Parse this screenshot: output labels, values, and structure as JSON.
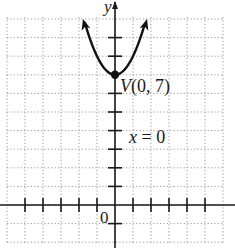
{
  "chart_data": {
    "type": "line",
    "title": "",
    "xlabel": "x",
    "ylabel": "y",
    "function": "y = x^2 + 7",
    "series": [
      {
        "name": "parabola",
        "x": [
          -1.67,
          -1.5,
          -1.25,
          -1,
          -0.75,
          -0.5,
          -0.25,
          0,
          0.25,
          0.5,
          0.75,
          1,
          1.25,
          1.5,
          1.67
        ],
        "y": [
          9.79,
          9.25,
          8.56,
          8,
          7.56,
          7.25,
          7.06,
          7,
          7.06,
          7.25,
          7.56,
          8,
          8.56,
          9.25,
          9.79
        ]
      }
    ],
    "xlim": [
      -6,
      6
    ],
    "ylim": [
      -1,
      10
    ],
    "grid": true,
    "x_ticks": [
      -5,
      -4,
      -3,
      -2,
      -1,
      1,
      2,
      3,
      4,
      5
    ],
    "y_ticks": [
      -1,
      1,
      2,
      3,
      4,
      5,
      6,
      8,
      9
    ],
    "annotations": [
      {
        "text": "V(0, 7)",
        "x": 0,
        "y": 7,
        "kind": "vertex"
      },
      {
        "text": "x = 0",
        "x": 0,
        "y": 4,
        "kind": "axis-of-symmetry"
      }
    ],
    "origin_label": "0",
    "vertex": {
      "x": 0,
      "y": 7
    }
  },
  "labels": {
    "y_axis": "y",
    "origin": "0",
    "vertex": "V(0, 7)",
    "axis_of_symmetry": "x = 0"
  }
}
